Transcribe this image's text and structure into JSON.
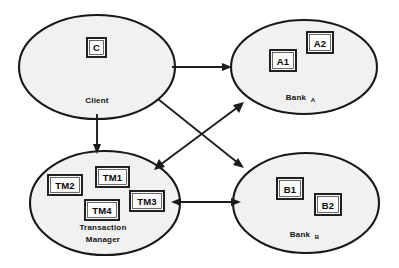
{
  "diagram": {
    "background_color": "#ffffff",
    "stroke_color": "#181818",
    "node_fill_color": "#f1f1f1",
    "nodes": [
      {
        "id": "client",
        "label": "Client",
        "subscript": "",
        "shape": "ellipse",
        "cx": 97,
        "cy": 67,
        "rx": 78,
        "ry": 52,
        "label_x": 97,
        "label_y": 103,
        "boxes": [
          {
            "id": "c",
            "label": "C",
            "x": 87,
            "y": 38,
            "w": 19,
            "h": 19
          }
        ]
      },
      {
        "id": "bank-a",
        "label": "Bank",
        "subscript": "A",
        "shape": "ellipse",
        "cx": 304,
        "cy": 67,
        "rx": 73,
        "ry": 47,
        "label_x": 296,
        "label_y": 100,
        "boxes": [
          {
            "id": "a1",
            "label": "A1",
            "x": 270,
            "y": 50,
            "w": 26,
            "h": 21
          },
          {
            "id": "a2",
            "label": "A2",
            "x": 307,
            "y": 32,
            "w": 26,
            "h": 21
          }
        ]
      },
      {
        "id": "transaction-manager",
        "label": "Transaction",
        "label_line2": "Manager",
        "subscript": "",
        "shape": "ellipse",
        "cx": 105,
        "cy": 203,
        "rx": 75,
        "ry": 52,
        "label_x": 103,
        "label_y": 229,
        "boxes": [
          {
            "id": "tm1",
            "label": "TM1",
            "x": 96,
            "y": 167,
            "w": 33,
            "h": 20
          },
          {
            "id": "tm2",
            "label": "TM2",
            "x": 48,
            "y": 175,
            "w": 34,
            "h": 20
          },
          {
            "id": "tm3",
            "label": "TM3",
            "x": 130,
            "y": 191,
            "w": 34,
            "h": 20
          },
          {
            "id": "tm4",
            "label": "TM4",
            "x": 85,
            "y": 200,
            "w": 34,
            "h": 20
          }
        ]
      },
      {
        "id": "bank-b",
        "label": "Bank",
        "subscript": "B",
        "shape": "ellipse",
        "cx": 306,
        "cy": 203,
        "rx": 73,
        "ry": 50,
        "label_x": 300,
        "label_y": 237,
        "boxes": [
          {
            "id": "b1",
            "label": "B1",
            "x": 277,
            "y": 178,
            "w": 26,
            "h": 21
          },
          {
            "id": "b2",
            "label": "B2",
            "x": 315,
            "y": 194,
            "w": 26,
            "h": 21
          }
        ]
      }
    ],
    "edges": [
      {
        "id": "client-to-bank-a",
        "from": "client",
        "to": "bank-a",
        "direction": "one-way",
        "x1": 172,
        "y1": 67,
        "x2": 229,
        "y2": 67
      },
      {
        "id": "client-to-transaction-manager",
        "from": "client",
        "to": "transaction-manager",
        "direction": "one-way",
        "x1": 97,
        "y1": 115,
        "x2": 97,
        "y2": 152
      },
      {
        "id": "client-to-bank-b",
        "from": "client",
        "to": "bank-b",
        "direction": "one-way",
        "x1": 159,
        "y1": 100,
        "x2": 243,
        "y2": 167
      },
      {
        "id": "transaction-manager-to-bank-a",
        "from": "transaction-manager",
        "to": "bank-a",
        "direction": "two-way",
        "x1": 156,
        "y1": 169,
        "x2": 243,
        "y2": 104
      },
      {
        "id": "transaction-manager-to-bank-b",
        "from": "transaction-manager",
        "to": "bank-b",
        "direction": "two-way",
        "x1": 173,
        "y1": 202,
        "x2": 239,
        "y2": 202
      }
    ]
  }
}
